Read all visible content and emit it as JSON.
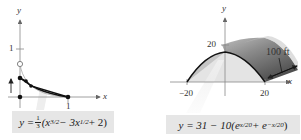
{
  "figures": [
    {
      "id": "left",
      "axis_labels": {
        "x": "x",
        "y": "y"
      },
      "ticks": {
        "y": [
          "1"
        ],
        "x": [
          "1"
        ]
      },
      "equation": {
        "lhs": "y =",
        "coef_num": "1",
        "coef_den": "3",
        "open": "(x",
        "exp1": "3/2",
        "mid": " − 3x",
        "exp2": "1/2",
        "tail": " + 2)",
        "text": "y = (1/3)(x^(3/2) − 3x^(1/2) + 2)"
      },
      "points": [
        {
          "x": 0,
          "y": 0.67,
          "style": "open"
        },
        {
          "x": 0,
          "y": 0.35,
          "style": "filled"
        },
        {
          "x": 0.12,
          "y": 0.28,
          "style": "filled"
        },
        {
          "x": 0.23,
          "y": 0.2,
          "style": "filled"
        },
        {
          "x": 1,
          "y": 0,
          "style": "filled"
        },
        {
          "x": 0,
          "y": 0,
          "style": "filled"
        }
      ]
    },
    {
      "id": "right",
      "axis_labels": {
        "x": "x",
        "y": "y"
      },
      "ticks": {
        "y": [
          "20"
        ],
        "x": [
          "−20",
          "20"
        ]
      },
      "annotation": "100 ft",
      "equation": {
        "lhs": "y = 31 − 10(e",
        "exp1": "x/20",
        "mid": " + e",
        "exp2": "−x/20",
        "tail": ")",
        "text": "y = 31 − 10(e^(x/20) + e^(−x/20))"
      }
    }
  ]
}
